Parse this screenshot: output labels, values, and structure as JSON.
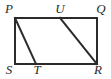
{
  "figure": {
    "kind": "geometry-diagram",
    "stroke_color": "#2b2b2b",
    "background_color": "#ffffff",
    "stroke_width": 2,
    "rectangle": {
      "name": "PQRS",
      "corners": {
        "P": {
          "label": "P",
          "x": 15,
          "y": 18
        },
        "Q": {
          "label": "Q",
          "x": 97,
          "y": 18
        },
        "R": {
          "label": "R",
          "x": 97,
          "y": 64
        },
        "S": {
          "label": "S",
          "x": 15,
          "y": 64
        }
      }
    },
    "points_on_edges": {
      "U": {
        "label": "U",
        "x": 60,
        "y": 18,
        "on_edge": "PQ"
      },
      "T": {
        "label": "T",
        "x": 36,
        "y": 64,
        "on_edge": "SR"
      }
    },
    "edges": [
      {
        "name": "PQ",
        "x1": 15,
        "y1": 18,
        "x2": 97,
        "y2": 18
      },
      {
        "name": "QR",
        "x1": 97,
        "y1": 18,
        "x2": 97,
        "y2": 64
      },
      {
        "name": "SR",
        "x1": 15,
        "y1": 64,
        "x2": 97,
        "y2": 64
      },
      {
        "name": "PS",
        "x1": 15,
        "y1": 18,
        "x2": 15,
        "y2": 64
      }
    ],
    "diagonals": [
      {
        "name": "PT",
        "x1": 15,
        "y1": 18,
        "x2": 36,
        "y2": 64
      },
      {
        "name": "UR",
        "x1": 60,
        "y1": 18,
        "x2": 97,
        "y2": 64
      }
    ],
    "labels": {
      "P": "P",
      "U": "U",
      "Q": "Q",
      "S": "S",
      "T": "T",
      "R": "R"
    }
  }
}
